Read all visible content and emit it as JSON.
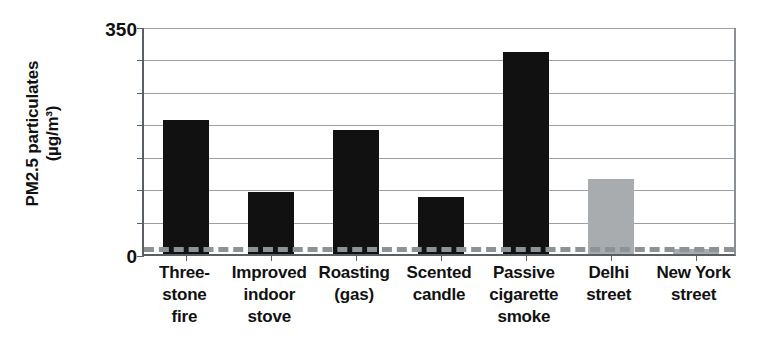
{
  "chart_data": {
    "type": "bar",
    "title": "",
    "xlabel": "",
    "ylabel": "PM2.5 particulates (µg/m³)",
    "ylabel_lines": [
      "PM2.5 particulates",
      "(µg/m³)"
    ],
    "ylim": [
      0,
      350
    ],
    "ytick_labels": [
      "350",
      "0"
    ],
    "ytick_values": [
      350,
      0
    ],
    "gridlines": [
      0,
      50,
      100,
      150,
      200,
      250,
      300,
      350
    ],
    "grid": true,
    "legend": "none",
    "categories": [
      "Three-stone fire",
      "Improved indoor stove",
      "Roasting (gas)",
      "Scented candle",
      "Passive cigarette smoke",
      "Delhi street",
      "New York street"
    ],
    "category_lines": [
      [
        "Three-",
        "stone",
        "fire"
      ],
      [
        "Improved",
        "indoor",
        "stove"
      ],
      [
        "Roasting",
        "(gas)"
      ],
      [
        "Scented",
        "candle"
      ],
      [
        "Passive",
        "cigarette",
        "smoke"
      ],
      [
        "Delhi",
        "street"
      ],
      [
        "New York",
        "street"
      ]
    ],
    "values": [
      205,
      95,
      190,
      88,
      310,
      115,
      8
    ],
    "bar_colors": [
      "#111111",
      "#111111",
      "#111111",
      "#111111",
      "#111111",
      "#a9acae",
      "#a9acae"
    ],
    "annotations": [
      {
        "type": "dashed-reference-line",
        "name": "guideline",
        "value": 14,
        "color": "#8d9296",
        "style": "dashed"
      }
    ]
  },
  "colors": {
    "bar_dark": "#111111",
    "bar_gray": "#a9acae",
    "gridline": "#9aa0a4",
    "axis": "#5a5f63",
    "background": "#ffffff"
  }
}
